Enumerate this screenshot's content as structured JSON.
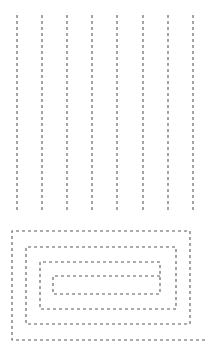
{
  "figure": {
    "title": "",
    "width": 217,
    "height": 351,
    "background_color": "#ffffff",
    "stroke_color": "#5a5a5a",
    "stroke_width": 1.1,
    "dash_pattern": "3 3"
  },
  "chart_data": {
    "type": "line",
    "title": "",
    "subtitle": "",
    "xlabel": "",
    "ylabel": "",
    "xlim": [
      0,
      217
    ],
    "ylim": [
      0,
      351
    ],
    "grid": false,
    "legend": "none",
    "annotations": [],
    "series": [
      {
        "name": "raster-zigzag-pass",
        "style": "dashed",
        "color": "#5a5a5a",
        "segments": [
          {
            "name": "raster-line-1",
            "x1": 17,
            "y1": 15,
            "x2": 17,
            "y2": 211
          },
          {
            "name": "raster-line-2",
            "x1": 42,
            "y1": 15,
            "x2": 42,
            "y2": 211
          },
          {
            "name": "raster-line-3",
            "x1": 67,
            "y1": 15,
            "x2": 67,
            "y2": 211
          },
          {
            "name": "raster-line-4",
            "x1": 92,
            "y1": 15,
            "x2": 92,
            "y2": 211
          },
          {
            "name": "raster-line-5",
            "x1": 117,
            "y1": 15,
            "x2": 117,
            "y2": 211
          },
          {
            "name": "raster-line-6",
            "x1": 143,
            "y1": 15,
            "x2": 143,
            "y2": 211
          },
          {
            "name": "raster-line-7",
            "x1": 168,
            "y1": 15,
            "x2": 168,
            "y2": 211
          },
          {
            "name": "raster-line-8",
            "x1": 193,
            "y1": 15,
            "x2": 193,
            "y2": 211
          }
        ]
      },
      {
        "name": "rectangular-spiral-pass",
        "style": "dashed",
        "color": "#5a5a5a",
        "polyline": "160,276 53,276 53,294 160,294 160,262 40,262 40,309 176,309 176,247 26,247 26,324 190,324 190,231 12,231 12,340 205,340"
      }
    ],
    "rings": [
      {
        "name": "spiral-ring-outer",
        "left": 12,
        "top": 231,
        "right": 205,
        "bottom": 340
      },
      {
        "name": "spiral-ring-second",
        "left": 26,
        "top": 247,
        "right": 190,
        "bottom": 324
      },
      {
        "name": "spiral-ring-third",
        "left": 40,
        "top": 262,
        "right": 176,
        "bottom": 309
      },
      {
        "name": "spiral-ring-inner",
        "left": 53,
        "top": 276,
        "right": 160,
        "bottom": 294
      }
    ]
  }
}
